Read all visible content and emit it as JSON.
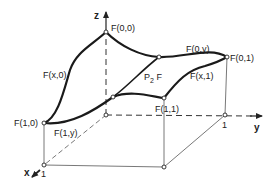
{
  "diagram": {
    "axes": {
      "z_label": "z",
      "y_label": "y",
      "x_label": "x",
      "x_tick": "1",
      "y_tick": "1"
    },
    "corner_labels": {
      "f00": "F(0,0)",
      "f01": "F(0,1)",
      "f10": "F(1,0)",
      "f11": "F(1,1)"
    },
    "boundary_curve_labels": {
      "fx0": "F(x,0)",
      "f0y": "F(0,y)",
      "fx1": "F(x,1)",
      "f1y": "F(1,y)"
    },
    "surface_label": {
      "main": "P",
      "subscript": "2",
      "suffix": " F"
    },
    "colors": {
      "curve": "#1a1a1a",
      "axis": "#333333",
      "background": "#ffffff"
    }
  }
}
